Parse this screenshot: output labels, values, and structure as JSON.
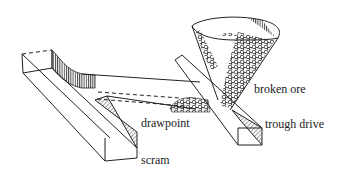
{
  "figure": {
    "labels": [
      {
        "id": "broken-ore",
        "text": "broken ore",
        "x": 254,
        "y": 88
      },
      {
        "id": "drawpoint",
        "text": "drawpoint",
        "x": 141,
        "y": 121
      },
      {
        "id": "trough-drive",
        "text": "trough drive",
        "x": 265,
        "y": 122
      },
      {
        "id": "scram",
        "text": "scram",
        "x": 141,
        "y": 158
      }
    ],
    "colors": {
      "line": "#222222",
      "hatch": "#333333",
      "background": "#ffffff"
    }
  }
}
